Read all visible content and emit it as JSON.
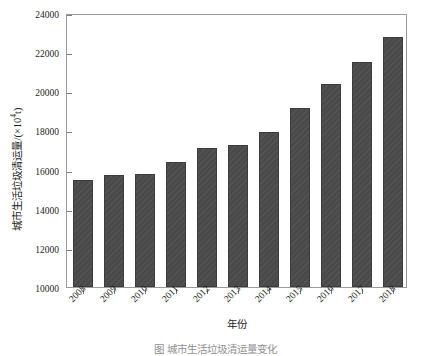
{
  "chart_data": {
    "type": "bar",
    "title": "",
    "categories": [
      "2008",
      "2009",
      "2010",
      "2011",
      "2012",
      "2013",
      "2014",
      "2015",
      "2016",
      "2017",
      "2018"
    ],
    "values": [
      15450,
      15730,
      15800,
      16400,
      17100,
      17250,
      17900,
      19150,
      20350,
      21520,
      22800
    ],
    "series": [
      {
        "name": "城市生活垃圾清运量",
        "values": [
          15450,
          15730,
          15800,
          16400,
          17100,
          17250,
          17900,
          19150,
          20350,
          21520,
          22800
        ]
      }
    ],
    "xlabel": "年份",
    "ylabel": "城市生活垃圾清运量/(×10⁴t)",
    "ylim": [
      10000,
      24000
    ],
    "yticks": [
      10000,
      12000,
      14000,
      16000,
      18000,
      20000,
      22000,
      24000
    ],
    "ytick_labels": [
      "10000",
      "12000",
      "14000",
      "16000",
      "18000",
      "20000",
      "22000",
      "24000"
    ],
    "grid": false,
    "legend": false,
    "legend_position": "none",
    "bar_color": "#4a4a4a",
    "frame_color": "#9a9a9a",
    "text_color": "#1d1d1d",
    "background": "#ffffff"
  },
  "axes": {
    "y_title_main": "城市生活垃圾清运量/(×10",
    "y_title_exponent": "4",
    "y_title_unit": "t)",
    "x_title": "年份"
  },
  "caption": {
    "text": "图      城市生活垃圾清运量变化"
  }
}
